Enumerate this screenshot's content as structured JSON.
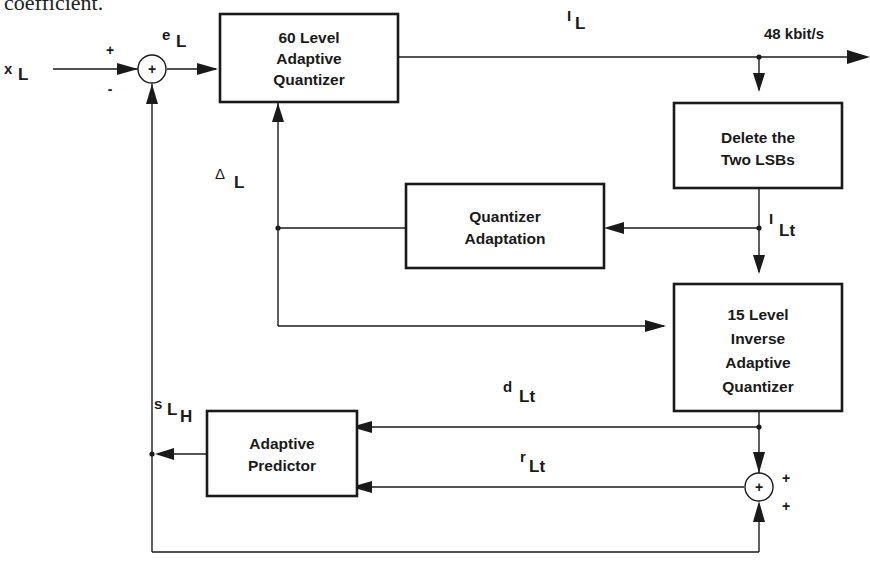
{
  "caption": {
    "text": "coefficient."
  },
  "blocks": {
    "quantizer60": {
      "lines": [
        "60 Level",
        "Adaptive",
        "Quantizer"
      ]
    },
    "delete_lsbs": {
      "lines": [
        "Delete the",
        "Two LSBs"
      ]
    },
    "quantizer_adaptation": {
      "lines": [
        "Quantizer",
        "Adaptation"
      ]
    },
    "inverse_quantizer15": {
      "lines": [
        "15 Level",
        "Inverse",
        "Adaptive",
        "Quantizer"
      ]
    },
    "adaptive_predictor": {
      "lines": [
        "Adaptive",
        "Predictor"
      ]
    }
  },
  "signals": {
    "x_L": {
      "main": "x",
      "sub": "L"
    },
    "e_L": {
      "main": "e",
      "sub": "L"
    },
    "I_L": {
      "main": "I",
      "sub": "L"
    },
    "I_Lt": {
      "main": "I",
      "sub": "Lt"
    },
    "delta_L": {
      "main": "Δ",
      "sub": "L"
    },
    "d_Lt": {
      "main": "d",
      "sub": "Lt"
    },
    "r_Lt": {
      "main": "r",
      "sub": "Lt"
    },
    "s_LH": {
      "main": "s",
      "sub": "L",
      "sub2": "H"
    }
  },
  "output_rate": "48 kbit/s",
  "adders": {
    "input_adder": {
      "symbol": "+",
      "sign_top": "+",
      "sign_bottom": "-"
    },
    "recon_adder": {
      "symbol": "+",
      "sign_top": "+",
      "sign_bottom": "+"
    }
  }
}
